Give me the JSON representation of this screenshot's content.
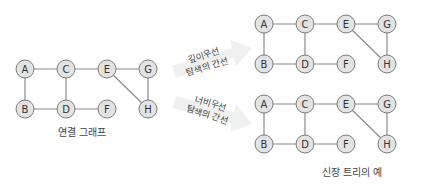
{
  "nodes": [
    "A",
    "B",
    "C",
    "D",
    "E",
    "F",
    "G",
    "H"
  ],
  "edges": [
    [
      "A",
      "C"
    ],
    [
      "A",
      "B"
    ],
    [
      "B",
      "D"
    ],
    [
      "C",
      "D"
    ],
    [
      "C",
      "E"
    ],
    [
      "D",
      "F"
    ],
    [
      "E",
      "G"
    ],
    [
      "E",
      "H"
    ],
    [
      "G",
      "H"
    ]
  ],
  "graphs": [
    {
      "id": "connected-graph",
      "caption": "연결 그래프",
      "edges": [
        [
          "A",
          "C"
        ],
        [
          "A",
          "B"
        ],
        [
          "B",
          "D"
        ],
        [
          "C",
          "D"
        ],
        [
          "C",
          "E"
        ],
        [
          "D",
          "F"
        ],
        [
          "E",
          "G"
        ],
        [
          "E",
          "H"
        ],
        [
          "G",
          "H"
        ]
      ]
    },
    {
      "id": "dfs-tree",
      "caption": "",
      "edges": [
        [
          "A",
          "C"
        ],
        [
          "A",
          "B"
        ],
        [
          "B",
          "D"
        ],
        [
          "C",
          "D"
        ],
        [
          "C",
          "E"
        ],
        [
          "D",
          "F"
        ],
        [
          "E",
          "G"
        ],
        [
          "E",
          "H"
        ],
        [
          "G",
          "H"
        ]
      ]
    },
    {
      "id": "bfs-tree",
      "caption": "",
      "edges": [
        [
          "A",
          "C"
        ],
        [
          "A",
          "B"
        ],
        [
          "B",
          "D"
        ],
        [
          "C",
          "D"
        ],
        [
          "C",
          "E"
        ],
        [
          "D",
          "F"
        ],
        [
          "E",
          "G"
        ],
        [
          "E",
          "H"
        ],
        [
          "G",
          "H"
        ]
      ]
    }
  ],
  "arrows": [
    {
      "line1": "깊이우선",
      "line2": "탐색의 간선"
    },
    {
      "line1": "너비우선",
      "line2": "탐색의 간선"
    }
  ],
  "right_caption": "신장 트리의 예",
  "colors": {
    "node_fill": "#e3e3e3",
    "node_stroke": "#7a7a7a",
    "edge": "#8a8a8a",
    "arrow": "#f0f0f0"
  }
}
